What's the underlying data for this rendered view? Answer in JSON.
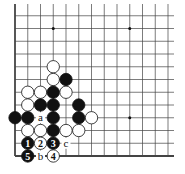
{
  "diagram": {
    "type": "go-board-corner",
    "corner": "bottom-left",
    "colors": {
      "black": "#111111",
      "white": "#ffffff",
      "line": "#444444",
      "background": "#ffffff"
    },
    "grid": {
      "origin_x": 15,
      "origin_y": 156,
      "spacing": 12.75,
      "cols": 13,
      "rows": 13
    },
    "star_points": [
      {
        "col": 3,
        "row": 10
      },
      {
        "col": 9,
        "row": 10
      },
      {
        "col": 9,
        "row": 3
      }
    ],
    "stones": [
      {
        "color": "white",
        "col": 3,
        "row": 7
      },
      {
        "color": "white",
        "col": 3,
        "row": 6
      },
      {
        "color": "black",
        "col": 4,
        "row": 6
      },
      {
        "color": "white",
        "col": 1,
        "row": 5
      },
      {
        "color": "white",
        "col": 2,
        "row": 5
      },
      {
        "color": "black",
        "col": 3,
        "row": 5
      },
      {
        "color": "white",
        "col": 4,
        "row": 5
      },
      {
        "color": "white",
        "col": 1,
        "row": 4
      },
      {
        "color": "black",
        "col": 2,
        "row": 4
      },
      {
        "color": "black",
        "col": 3,
        "row": 4
      },
      {
        "color": "black",
        "col": 5,
        "row": 4
      },
      {
        "color": "black",
        "col": 0,
        "row": 3
      },
      {
        "color": "black",
        "col": 1,
        "row": 3
      },
      {
        "color": "black",
        "col": 3,
        "row": 3
      },
      {
        "color": "black",
        "col": 5,
        "row": 3
      },
      {
        "color": "white",
        "col": 6,
        "row": 3
      },
      {
        "color": "white",
        "col": 1,
        "row": 2
      },
      {
        "color": "white",
        "col": 2,
        "row": 2
      },
      {
        "color": "black",
        "col": 3,
        "row": 2
      },
      {
        "color": "white",
        "col": 4,
        "row": 2
      },
      {
        "color": "white",
        "col": 5,
        "row": 2
      },
      {
        "color": "black",
        "col": 1,
        "row": 1,
        "label": "1"
      },
      {
        "color": "white",
        "col": 2,
        "row": 1,
        "label": "2"
      },
      {
        "color": "black",
        "col": 3,
        "row": 1,
        "label": "3"
      },
      {
        "color": "white",
        "col": 3,
        "row": 0,
        "label": "4"
      },
      {
        "color": "black",
        "col": 1,
        "row": 0,
        "label": "5"
      }
    ],
    "marks": [
      {
        "label": "a",
        "col": 2,
        "row": 3
      },
      {
        "label": "b",
        "col": 2,
        "row": 0
      },
      {
        "label": "c",
        "col": 4,
        "row": 1
      }
    ]
  }
}
